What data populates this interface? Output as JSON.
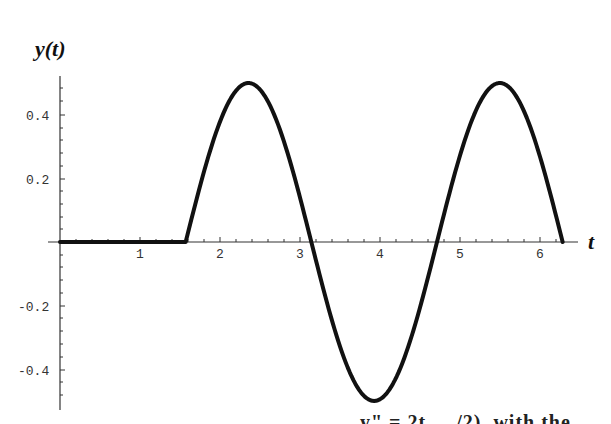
{
  "chart_data": {
    "type": "line",
    "title": "",
    "xlabel": "t",
    "ylabel": "y(t)",
    "xlim": [
      0,
      6.283
    ],
    "ylim": [
      -0.5,
      0.5
    ],
    "x_ticks": [
      1,
      2,
      3,
      4,
      5,
      6
    ],
    "y_ticks": [
      -0.4,
      -0.2,
      0.2,
      0.4
    ],
    "x_tick_labels": [
      "1",
      "2",
      "3",
      "4",
      "5",
      "6"
    ],
    "y_tick_labels": [
      "-0.4",
      "-0.2",
      "0.2",
      "0.4"
    ],
    "grid": false,
    "legend": null,
    "series": [
      {
        "name": "y(t)",
        "description": "y(t) = 0 for t < pi/2; y(t) = -0.5 sin(2t) for pi/2 <= t <= 2pi",
        "x": [
          0,
          1.571,
          1.963,
          2.356,
          2.749,
          3.142,
          3.534,
          3.927,
          4.32,
          4.712,
          5.105,
          5.498,
          5.89,
          6.283
        ],
        "values": [
          0,
          0,
          0.354,
          0.5,
          0.354,
          0,
          -0.354,
          -0.5,
          -0.354,
          0,
          0.354,
          0.5,
          0.354,
          0
        ]
      }
    ]
  },
  "labels": {
    "y_axis": "y(t)",
    "x_axis": "t",
    "ticks_x": [
      "1",
      "2",
      "3",
      "4",
      "5",
      "6"
    ],
    "ticks_y_pos": [
      "0.4",
      "0.2"
    ],
    "ticks_y_neg": [
      "-0.2",
      "-0.4"
    ]
  },
  "caption_fragment": "...  ..  y\" = 2t ... /2), with the"
}
